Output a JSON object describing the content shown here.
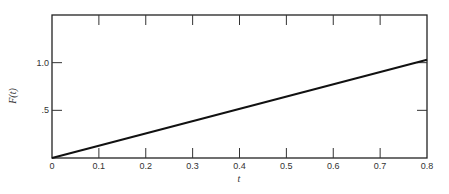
{
  "chart_data": {
    "type": "line",
    "title": "",
    "xlabel": "t",
    "ylabel": "F(t)",
    "xlim": [
      0,
      0.8
    ],
    "ylim": [
      0,
      1.5
    ],
    "grid": false,
    "legend": null,
    "x_ticks": [
      "0",
      "0.1",
      "0.2",
      "0.3",
      "0.4",
      "0.5",
      "0.6",
      "0.7",
      "0.8"
    ],
    "y_ticks": [
      ".5",
      "1.0"
    ],
    "series": [
      {
        "name": "F(t)",
        "x": [
          0,
          0.8
        ],
        "y": [
          0,
          1.03
        ]
      }
    ]
  }
}
